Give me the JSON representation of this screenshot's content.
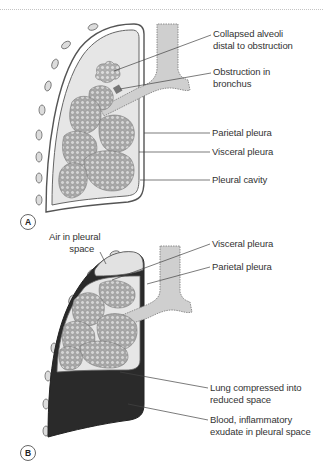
{
  "figure": {
    "panels": [
      {
        "id": "A",
        "badge": "A",
        "labels": [
          {
            "text": "Collapsed alveoli\ndistal to obstruction"
          },
          {
            "text": "Obstruction in\nbronchus"
          },
          {
            "text": "Parietal pleura"
          },
          {
            "text": "Visceral pleura"
          },
          {
            "text": "Pleural cavity"
          }
        ]
      },
      {
        "id": "B",
        "badge": "B",
        "labels": [
          {
            "text": "Air in pleural\n        space"
          },
          {
            "text": "Visceral pleura"
          },
          {
            "text": "Parietal pleura"
          },
          {
            "text": "Lung compressed into\nreduced space"
          },
          {
            "text": "Blood, inflammatory\nexudate in pleural space"
          }
        ]
      }
    ],
    "colors": {
      "lung_fill": "#e6e6e6",
      "alveoli": "#b9b9b9",
      "airway": "#cfcfcf",
      "fluid": "#2a2a2a",
      "outline": "#555555",
      "leader": "#444444"
    }
  }
}
